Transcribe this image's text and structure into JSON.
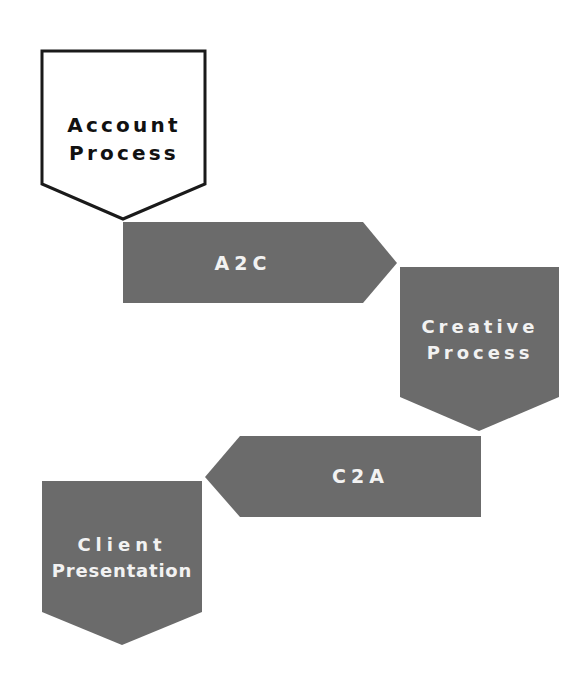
{
  "diagram": {
    "type": "process-flow",
    "colors": {
      "background": "#ffffff",
      "outline_stroke": "#1a1a1a",
      "outline_fill": "#ffffff",
      "filled_shape": "#6b6b6b",
      "dark_text": "#111111",
      "light_text": "#f2f2f2"
    },
    "nodes": [
      {
        "id": "account-process",
        "shape": "pentagon-down",
        "style": "outlined",
        "label_lines": [
          "Account",
          "Process"
        ]
      },
      {
        "id": "a2c",
        "shape": "arrow-right",
        "style": "filled",
        "label": "A2C"
      },
      {
        "id": "creative-process",
        "shape": "pentagon-down",
        "style": "filled",
        "label_lines": [
          "Creative",
          "Process"
        ]
      },
      {
        "id": "c2a",
        "shape": "arrow-left",
        "style": "filled",
        "label": "C2A"
      },
      {
        "id": "client-presentation",
        "shape": "pentagon-down",
        "style": "filled",
        "label_lines": [
          "Client",
          "Presentation"
        ]
      }
    ],
    "flow": [
      "Account Process",
      "A2C",
      "Creative Process",
      "C2A",
      "Client Presentation"
    ]
  }
}
